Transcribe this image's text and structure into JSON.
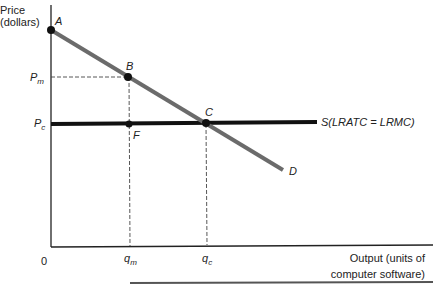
{
  "diagram": {
    "y_axis_label_line1": "Price",
    "y_axis_label_line2": "(dollars)",
    "x_axis_label_line1": "Output (units of",
    "x_axis_label_line2": "computer software)",
    "origin_label": "0",
    "price_labels": {
      "pm_base": "P",
      "pm_sub": "m",
      "pc_base": "P",
      "pc_sub": "c"
    },
    "quantity_labels": {
      "qm_base": "q",
      "qm_sub": "m",
      "qc_base": "q",
      "qc_sub": "c"
    },
    "points": {
      "A": "A",
      "B": "B",
      "C": "C",
      "F": "F"
    },
    "curves": {
      "demand": "D",
      "supply": "S(LRATC = LRMC)"
    },
    "colors": {
      "demand_line": "#6b6b6b",
      "supply_line": "#111111",
      "axis": "#222222",
      "dashed": "#444444"
    }
  }
}
